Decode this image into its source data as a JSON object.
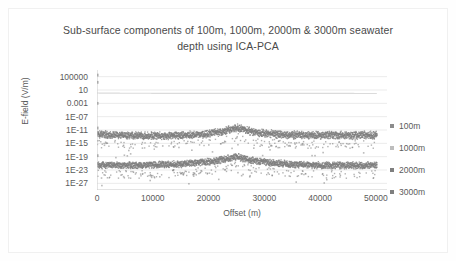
{
  "chart_data": {
    "type": "scatter",
    "title": "Sub-surface components of 100m, 1000m, 2000m & 3000m seawater depth using ICA-PCA",
    "title_line1": "Sub-surface components of 100m, 1000m, 2000m & 3000m seawater",
    "title_line2": "depth using ICA-PCA",
    "xlabel": "Offset (m)",
    "ylabel": "E-field (V/m)",
    "yscale": "log",
    "ylim": [
      1e-29,
      10000000.0
    ],
    "xlim": [
      0,
      52000
    ],
    "grid": true,
    "legend_position": "right",
    "xticks": [
      0,
      10000,
      20000,
      30000,
      40000,
      50000
    ],
    "xtick_labels": [
      "0",
      "10000",
      "20000",
      "30000",
      "40000",
      "50000"
    ],
    "yticks": [
      100000,
      10,
      0.001,
      1e-07,
      1e-11,
      1e-15,
      1e-19,
      1e-23,
      1e-27
    ],
    "ytick_labels": [
      "100000",
      "10",
      "0.001",
      "1E-07",
      "1E-11",
      "1E-15",
      "1E-19",
      "1E-23",
      "1E-27"
    ],
    "series": [
      {
        "name": "100m",
        "color": "#8c8c8c",
        "marker": "square",
        "description": "Isolated high-amplitude points clustered at offset 0 near 100000 and 1000",
        "points": [
          {
            "x": 0,
            "y": 300000.0
          },
          {
            "x": 0,
            "y": 2000.0
          },
          {
            "x": 0,
            "y": 0.001
          },
          {
            "x": 0,
            "y": 4e-11
          },
          {
            "x": 0,
            "y": 2e-19
          }
        ]
      },
      {
        "name": "1000m",
        "color": "#bdbdbd",
        "marker": "line",
        "description": "Near-flat faint horizontal trace at approximately 1 V/m across all offsets",
        "baseline": 1.0,
        "points": [
          {
            "x": 0,
            "y": 1.2
          },
          {
            "x": 10000,
            "y": 1.0
          },
          {
            "x": 20000,
            "y": 1.0
          },
          {
            "x": 25000,
            "y": 1.0
          },
          {
            "x": 30000,
            "y": 1.0
          },
          {
            "x": 40000,
            "y": 1.0
          },
          {
            "x": 50000,
            "y": 0.9
          }
        ]
      },
      {
        "name": "2000m",
        "color": "#7f7f7f",
        "marker": "square",
        "description": "Dense noisy band between 1E-12 and 1E-16 with a broad bump peaking near offset 25000",
        "baseline_top": 1e-12,
        "baseline_bottom": 1e-16,
        "peak_x": 25000,
        "peak_y": 3e-11,
        "points": [
          {
            "x": 0,
            "y": 3e-13
          },
          {
            "x": 2500,
            "y": 2e-13
          },
          {
            "x": 5000,
            "y": 1.5e-13
          },
          {
            "x": 7500,
            "y": 1.2e-13
          },
          {
            "x": 10000,
            "y": 1e-13
          },
          {
            "x": 12500,
            "y": 1.2e-13
          },
          {
            "x": 15000,
            "y": 1.5e-13
          },
          {
            "x": 17500,
            "y": 2.5e-13
          },
          {
            "x": 20000,
            "y": 5e-13
          },
          {
            "x": 22500,
            "y": 2e-12
          },
          {
            "x": 25000,
            "y": 3e-11
          },
          {
            "x": 27500,
            "y": 2e-12
          },
          {
            "x": 30000,
            "y": 5e-13
          },
          {
            "x": 32500,
            "y": 3e-13
          },
          {
            "x": 35000,
            "y": 2e-13
          },
          {
            "x": 37500,
            "y": 1.8e-13
          },
          {
            "x": 40000,
            "y": 1.6e-13
          },
          {
            "x": 42500,
            "y": 1.5e-13
          },
          {
            "x": 45000,
            "y": 1.5e-13
          },
          {
            "x": 47500,
            "y": 1.6e-13
          },
          {
            "x": 50000,
            "y": 1.8e-13
          }
        ]
      },
      {
        "name": "3000m",
        "color": "#7f7f7f",
        "marker": "square",
        "description": "Dense noisy band between 1E-21 and 1E-25 with a sharp triangular peak near offset 25000",
        "baseline_top": 1e-21,
        "baseline_bottom": 1e-25,
        "peak_x": 25000,
        "peak_y": 6e-20,
        "points": [
          {
            "x": 0,
            "y": 2e-22
          },
          {
            "x": 2500,
            "y": 1.5e-22
          },
          {
            "x": 5000,
            "y": 1.4e-22
          },
          {
            "x": 7500,
            "y": 1.5e-22
          },
          {
            "x": 10000,
            "y": 1.8e-22
          },
          {
            "x": 12500,
            "y": 2.5e-22
          },
          {
            "x": 15000,
            "y": 4e-22
          },
          {
            "x": 17500,
            "y": 8e-22
          },
          {
            "x": 20000,
            "y": 2e-21
          },
          {
            "x": 22500,
            "y": 8e-21
          },
          {
            "x": 25000,
            "y": 6e-20
          },
          {
            "x": 27500,
            "y": 6e-21
          },
          {
            "x": 30000,
            "y": 1.5e-21
          },
          {
            "x": 32500,
            "y": 6e-22
          },
          {
            "x": 35000,
            "y": 3e-22
          },
          {
            "x": 37500,
            "y": 2.2e-22
          },
          {
            "x": 40000,
            "y": 1.8e-22
          },
          {
            "x": 42500,
            "y": 1.6e-22
          },
          {
            "x": 45000,
            "y": 1.5e-22
          },
          {
            "x": 47500,
            "y": 1.5e-22
          },
          {
            "x": 50000,
            "y": 1.6e-22
          }
        ]
      }
    ],
    "legend": [
      "100m",
      "1000m",
      "2000m",
      "3000m"
    ]
  }
}
